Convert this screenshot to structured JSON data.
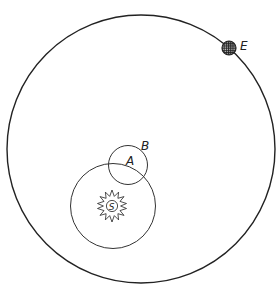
{
  "diagram": {
    "title": "",
    "colors": {
      "stroke": "#222222",
      "background": "#ffffff"
    },
    "orbits": {
      "earth_orbit": {
        "cx": 141,
        "cy": 149,
        "r": 134
      },
      "deferent": {
        "cx": 113,
        "cy": 206,
        "r": 42.5
      },
      "epicycle": {
        "cx": 128,
        "cy": 165,
        "r": 19.5
      }
    },
    "bodies": {
      "sun": {
        "label": "S",
        "cx": 112,
        "cy": 206
      },
      "earth": {
        "cx": 229,
        "cy": 48,
        "r": 7
      }
    },
    "labels": {
      "earth": "E",
      "point_b": "B",
      "point_a": "A",
      "sun": "S"
    }
  }
}
